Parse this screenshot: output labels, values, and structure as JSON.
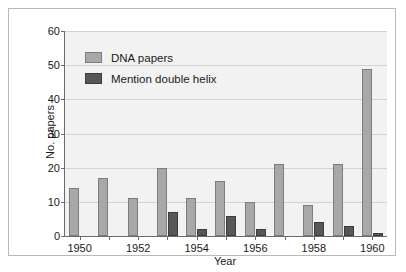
{
  "figure": {
    "background_color": "#ffffff",
    "plot_background_color": "#f2f2f2",
    "frame_border_color": "#b9b9b9"
  },
  "chart_data": {
    "type": "bar",
    "title": "",
    "subtitle": "",
    "xlabel": "Year",
    "ylabel": "No. papers",
    "categories": [
      "1950",
      "1951",
      "1952",
      "1953",
      "1954",
      "1955",
      "1956",
      "1957",
      "1958",
      "1959",
      "1960"
    ],
    "visible_tick_labels": [
      "1950",
      "",
      "1952",
      "",
      "1954",
      "",
      "1956",
      "",
      "1958",
      "",
      "1960"
    ],
    "series": [
      {
        "name": "DNA papers",
        "color": "#a8a8a8",
        "values": [
          14,
          17,
          11,
          20,
          11,
          16,
          10,
          21,
          9,
          21,
          49
        ]
      },
      {
        "name": "Mention double helix",
        "color": "#575757",
        "values": [
          0,
          0,
          0,
          7,
          2,
          6,
          2,
          0,
          4,
          3,
          1
        ]
      }
    ],
    "ylim": [
      0,
      60
    ],
    "ytick_values": [
      0,
      10,
      20,
      30,
      40,
      50,
      60
    ],
    "ytick_labels": [
      "0",
      "10",
      "20",
      "30",
      "40",
      "50",
      "60"
    ],
    "grid": true,
    "grid_axis": "y",
    "legend_position": "upper-left",
    "bar_group_mode": "grouped"
  },
  "legend": {
    "entries": [
      {
        "label": "DNA papers",
        "swatch": "light"
      },
      {
        "label": "Mention double helix",
        "swatch": "dark"
      }
    ]
  }
}
